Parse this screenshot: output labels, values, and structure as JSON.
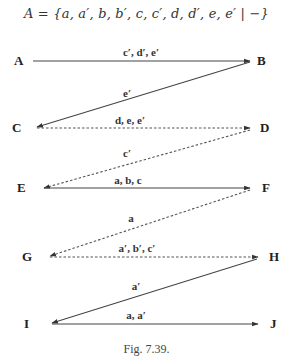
{
  "formula": "A = {a, a′, b, b′, c, c′, d, d′, e, e′ | −}",
  "caption": "Fig. 7.39.",
  "colors": {
    "line": "#444444",
    "text": "#222222"
  },
  "nodes": [
    {
      "id": "A",
      "label": "A",
      "x": 17,
      "y": 65
    },
    {
      "id": "B",
      "label": "B",
      "x": 258,
      "y": 65
    },
    {
      "id": "C",
      "label": "C",
      "x": 13,
      "y": 132
    },
    {
      "id": "D",
      "label": "D",
      "x": 261,
      "y": 132
    },
    {
      "id": "E",
      "label": "E",
      "x": 17,
      "y": 192
    },
    {
      "id": "F",
      "label": "F",
      "x": 262,
      "y": 192
    },
    {
      "id": "G",
      "label": "G",
      "x": 22,
      "y": 261
    },
    {
      "id": "H",
      "label": "H",
      "x": 270,
      "y": 261
    },
    {
      "id": "I",
      "label": "I",
      "x": 24,
      "y": 328
    },
    {
      "id": "J",
      "label": "J",
      "x": 270,
      "y": 328
    }
  ],
  "edges": [
    {
      "from": "A",
      "to": "B",
      "label": "c′, d′, e′",
      "style": "solid"
    },
    {
      "from": "B",
      "to": "C",
      "label": "e′",
      "style": "solid"
    },
    {
      "from": "C",
      "to": "D",
      "label": "d, e, e′",
      "style": "dashed"
    },
    {
      "from": "D",
      "to": "E",
      "label": "c′",
      "style": "dashed"
    },
    {
      "from": "E",
      "to": "F",
      "label": "a, b, c",
      "style": "solid"
    },
    {
      "from": "F",
      "to": "G",
      "label": "a",
      "style": "dashed"
    },
    {
      "from": "G",
      "to": "H",
      "label": "a′, b′, c′",
      "style": "dashed"
    },
    {
      "from": "H",
      "to": "I",
      "label": "a′",
      "style": "solid"
    },
    {
      "from": "I",
      "to": "J",
      "label": "a, a′",
      "style": "solid"
    }
  ]
}
